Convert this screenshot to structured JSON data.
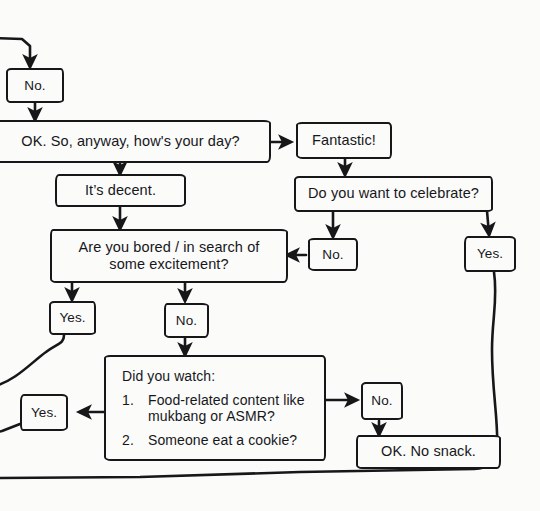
{
  "diagram": {
    "background_color": "#fbfbfa",
    "ink_color": "#17171a",
    "nodes": {
      "no_top": "No.",
      "how_is_your_day": "OK. So, anyway, how's your day?",
      "fantastic": "Fantastic!",
      "its_decent": "It’s decent.",
      "celebrate": "Do you want to celebrate?",
      "no_celebrate": "No.",
      "yes_celebrate": "Yes.",
      "bored_line1": "Are you bored / in search of",
      "bored_line2": "some excitement?",
      "yes_bored": "Yes.",
      "no_bored": "No.",
      "did_you_watch_lead": "Did you watch:",
      "watch_items": [
        {
          "num": "1.",
          "line1": "Food-related content like",
          "line2": "mukbang or ASMR?"
        },
        {
          "num": "2.",
          "line1": "Someone eat a cookie?",
          "line2": ""
        }
      ],
      "yes_watch": "Yes.",
      "no_watch": "No.",
      "ok_no_snack": "OK. No snack."
    }
  }
}
